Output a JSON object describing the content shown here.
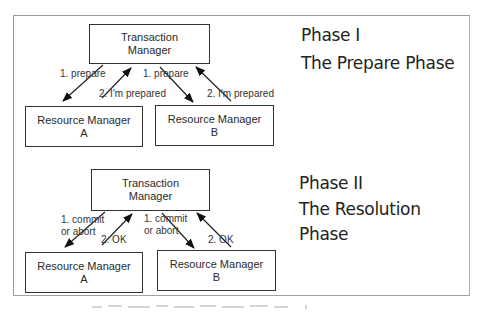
{
  "phase1": {
    "title": "Phase I",
    "subtitle": "The Prepare Phase",
    "transaction_manager": {
      "line1": "Transaction",
      "line2": "Manager"
    },
    "resource_a": {
      "line1": "Resource Manager",
      "line2": "A"
    },
    "resource_b": {
      "line1": "Resource Manager",
      "line2": "B"
    },
    "labels": {
      "prepare_a": "1. prepare",
      "prepared_a": "2. I'm prepared",
      "prepare_b": "1. prepare",
      "prepared_b": "2. I'm prepared"
    }
  },
  "phase2": {
    "title": "Phase II",
    "subtitle_line1": "The Resolution",
    "subtitle_line2": "Phase",
    "transaction_manager": {
      "line1": "Transaction",
      "line2": "Manager"
    },
    "resource_a": {
      "line1": "Resource Manager",
      "line2": "A"
    },
    "resource_b": {
      "line1": "Resource Manager",
      "line2": "B"
    },
    "labels": {
      "commit_a_line1": "1. commit",
      "commit_a_line2": "or abort",
      "ok_a": "2. OK",
      "commit_b_line1": "1. commit",
      "commit_b_line2": "or abort",
      "ok_b": "2. OK"
    }
  },
  "colors": {
    "line": "#222222",
    "frame": "#9a9a9a",
    "text": "#2a2a2a"
  }
}
